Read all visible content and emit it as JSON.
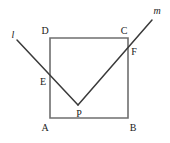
{
  "figure": {
    "background_color": "#ffffff",
    "width": 170,
    "height": 143,
    "square_stroke_color": "#6f6f6f",
    "ray_stroke_color": "#3a3a3a",
    "label_color": "#1a1a1a"
  },
  "labels": {
    "A": "A",
    "B": "B",
    "C": "C",
    "D": "D",
    "E": "E",
    "F": "F",
    "P": "P",
    "l": "l",
    "m": "m"
  },
  "geometry": {
    "square": {
      "name": "ABCD",
      "vertices": {
        "A": {
          "x": 50,
          "y": 118
        },
        "B": {
          "x": 128,
          "y": 118
        },
        "C": {
          "x": 128,
          "y": 38
        },
        "D": {
          "x": 50,
          "y": 38
        }
      },
      "side_length_px": 80,
      "path": "M 50 38 L 128 38 L 128 118 L 50 118 Z"
    },
    "points": {
      "E": {
        "x": 50,
        "y": 78,
        "on": "side-AD"
      },
      "F": {
        "x": 128,
        "y": 47,
        "on": "side-BC"
      },
      "P": {
        "x": 78,
        "y": 105,
        "on": "interior"
      }
    },
    "rays": [
      {
        "name": "l",
        "from": {
          "x": 17,
          "y": 40
        },
        "through": {
          "x": 50,
          "y": 78
        },
        "to": {
          "x": 78,
          "y": 105
        },
        "path": "M 17 40 L 78 105"
      },
      {
        "name": "m",
        "from": {
          "x": 78,
          "y": 105
        },
        "through": {
          "x": 128,
          "y": 47
        },
        "to": {
          "x": 152,
          "y": 20
        },
        "path": "M 78 105 L 152 20"
      }
    ]
  },
  "label_positions": {
    "A": {
      "x": 45,
      "y": 128
    },
    "B": {
      "x": 133,
      "y": 128
    },
    "C": {
      "x": 124,
      "y": 31
    },
    "D": {
      "x": 45,
      "y": 31
    },
    "E": {
      "x": 43,
      "y": 82
    },
    "F": {
      "x": 134,
      "y": 52
    },
    "P": {
      "x": 79,
      "y": 114
    },
    "l": {
      "x": 13,
      "y": 35
    },
    "m": {
      "x": 157,
      "y": 11
    }
  }
}
